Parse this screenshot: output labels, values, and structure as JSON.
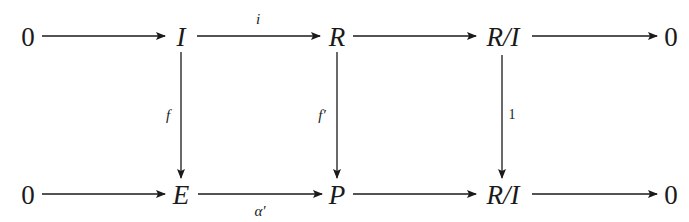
{
  "diagram": {
    "type": "commutative-diagram",
    "top_row": {
      "nodes": [
        "0",
        "I",
        "R",
        "R/I",
        "0"
      ],
      "arrows": [
        {
          "from": "0",
          "to": "I",
          "label": ""
        },
        {
          "from": "I",
          "to": "R",
          "label": "i"
        },
        {
          "from": "R",
          "to": "R/I",
          "label": ""
        },
        {
          "from": "R/I",
          "to": "0",
          "label": ""
        }
      ]
    },
    "bottom_row": {
      "nodes": [
        "0",
        "E",
        "P",
        "R/I",
        "0"
      ],
      "arrows": [
        {
          "from": "0",
          "to": "E",
          "label": ""
        },
        {
          "from": "E",
          "to": "P",
          "label": "α′"
        },
        {
          "from": "P",
          "to": "R/I",
          "label": ""
        },
        {
          "from": "R/I",
          "to": "0",
          "label": ""
        }
      ]
    },
    "vertical_arrows": [
      {
        "from": "I",
        "to": "E",
        "label": "f"
      },
      {
        "from": "R",
        "to": "P",
        "label": "f′"
      },
      {
        "from": "R/I",
        "to": "R/I",
        "label": "1"
      }
    ],
    "labels": {
      "top_i": "i",
      "bottom_alpha": "α′",
      "vert_f": "f",
      "vert_fprime": "f′",
      "vert_one": "1"
    },
    "colors": {
      "ink": "#1a1a1a",
      "background": "#ffffff"
    }
  }
}
